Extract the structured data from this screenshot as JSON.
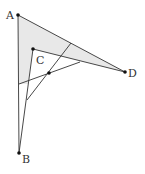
{
  "diagram": {
    "type": "geometry",
    "points": {
      "A": {
        "label": "A",
        "x": 18,
        "y": 15
      },
      "B": {
        "label": "B",
        "x": 19,
        "y": 153
      },
      "C": {
        "label": "C",
        "x": 33,
        "y": 49
      },
      "D": {
        "label": "D",
        "x": 125,
        "y": 72
      },
      "E": {
        "label": "",
        "x": 49,
        "y": 73
      }
    },
    "colors": {
      "stroke": "#333333",
      "fill": "#e6e6e6"
    }
  }
}
